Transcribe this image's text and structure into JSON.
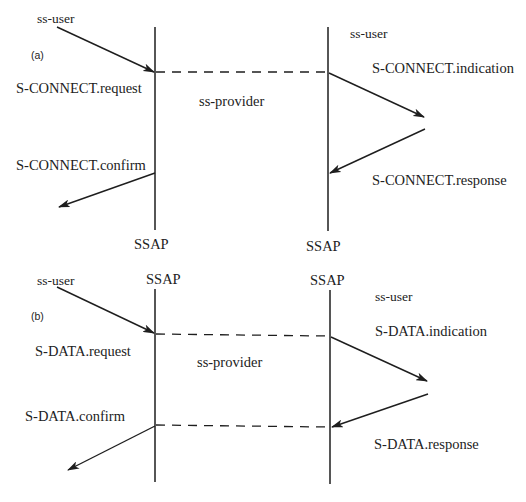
{
  "panels": {
    "a": {
      "tag": "(a)",
      "left_user": "ss-user",
      "right_user": "ss-user",
      "provider": "ss-provider",
      "request": "S-CONNECT.request",
      "indication": "S-CONNECT.indication",
      "response": "S-CONNECT.response",
      "confirm": "S-CONNECT.confirm",
      "left_sap": "SSAP",
      "right_sap": "SSAP"
    },
    "b": {
      "tag": "(b)",
      "left_user": "ss-user",
      "right_user": "ss-user",
      "provider": "ss-provider",
      "request": "S-DATA.request",
      "indication": "S-DATA.indication",
      "response": "S-DATA.response",
      "confirm": "S-DATA.confirm",
      "left_sap": "SSAP",
      "right_sap": "SSAP"
    }
  },
  "colors": {
    "line": "#1e1e1e",
    "text": "#222222",
    "background": "#ffffff"
  }
}
